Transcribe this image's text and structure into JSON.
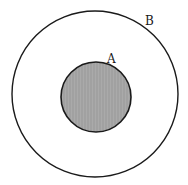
{
  "diagram": {
    "outer_circle": {
      "label": "B",
      "cx": 95,
      "cy": 94,
      "r": 83,
      "fill": "#ffffff",
      "stroke": "#1a1a1a"
    },
    "inner_circle": {
      "label": "A",
      "cx": 96,
      "cy": 97,
      "r": 35,
      "fill": "#a8a8a8",
      "stroke": "#1a1a1a"
    }
  }
}
